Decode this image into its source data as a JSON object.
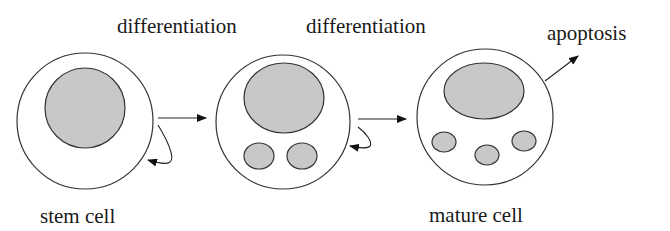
{
  "labels": {
    "differentiation_1": "differentiation",
    "differentiation_2": "differentiation",
    "apoptosis": "apoptosis",
    "stem_cell": "stem cell",
    "mature_cell": "mature cell"
  },
  "colors": {
    "nucleus_fill": "#c8c8c8",
    "outline": "#333333",
    "arrow": "#111111"
  },
  "cells": [
    {
      "name": "stem cell",
      "granules": 0
    },
    {
      "name": "intermediate cell",
      "granules": 2
    },
    {
      "name": "mature cell",
      "granules": 3
    }
  ]
}
